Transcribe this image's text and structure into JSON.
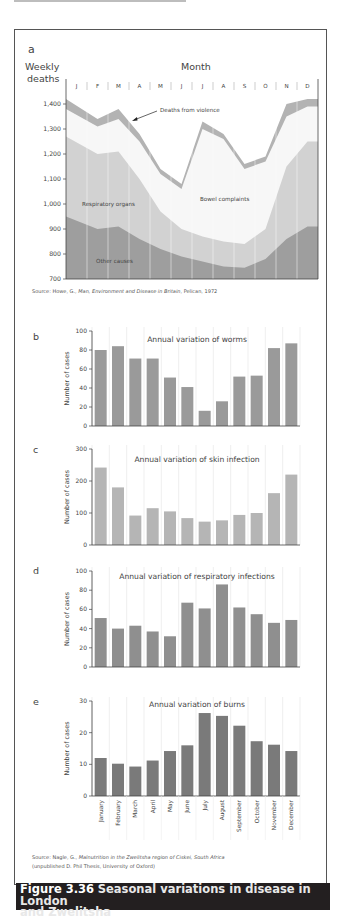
{
  "figure": {
    "number": "Figure 3.36",
    "title": "Seasonal variations in disease in London and Zwelitsha",
    "title_line1": "Seasonal variations in disease in London",
    "title_line2": "and Zwelitsha"
  },
  "panel_a": {
    "letter": "a",
    "ylabel_line1": "Weekly",
    "ylabel_line2": "deaths",
    "xlabel": "Month",
    "months": [
      "J",
      "F",
      "M",
      "A",
      "M",
      "J",
      "J",
      "A",
      "S",
      "O",
      "N",
      "D"
    ],
    "yticks": [
      "1,400",
      "1,300",
      "1,200",
      "1,100",
      "1,000",
      "900",
      "800",
      "700"
    ],
    "annotations": {
      "violence": "Deaths from violence",
      "respiratory": "Respiratory organs",
      "bowel": "Bowel complaints",
      "other": "Other causes"
    },
    "source_prefix": "Source: Howe, G., ",
    "source_title": "Man, Environment and Disease in Britain",
    "source_suffix": ", Pelican, 1972",
    "colors": {
      "other": "#9e9e9e",
      "respiratory": "#d2d2d2",
      "bowel": "#f7f7f7",
      "violence": "#b3b3b3"
    }
  },
  "bar_charts": {
    "ylabel": "Number of cases",
    "months": [
      "January",
      "February",
      "March",
      "April",
      "May",
      "June",
      "July",
      "August",
      "September",
      "October",
      "November",
      "December"
    ],
    "source_prefix": "Source: Nagle, G., ",
    "source_title": "Malnutrition in the Zwelitsha region of Ciskei, South Africa",
    "source_line2": "(unpublished D. Phil Thesis, University of Oxford)",
    "b": {
      "letter": "b",
      "title": "Annual variation of worms",
      "yticks": [
        "100",
        "80",
        "60",
        "40",
        "20",
        "0"
      ],
      "color": "#9a9a9a"
    },
    "c": {
      "letter": "c",
      "title": "Annual variation of skin infection",
      "yticks": [
        "300",
        "200",
        "100",
        "0"
      ],
      "color": "#b5b5b5"
    },
    "d": {
      "letter": "d",
      "title": "Annual variation of respiratory infections",
      "yticks": [
        "100",
        "80",
        "60",
        "40",
        "20",
        "0"
      ],
      "color": "#8f8f8f"
    },
    "e": {
      "letter": "e",
      "title": "Annual variation of burns",
      "yticks": [
        "30",
        "20",
        "10",
        "0"
      ],
      "color": "#7a7a7a"
    }
  },
  "chart_data": [
    {
      "type": "area",
      "title": "Weekly deaths by cause (London)",
      "xlabel": "Month",
      "ylabel": "Weekly deaths",
      "ylim": [
        700,
        1450
      ],
      "categories": [
        "J",
        "F",
        "M",
        "A",
        "M",
        "J",
        "J",
        "A",
        "S",
        "O",
        "N",
        "D"
      ],
      "stacking": "cumulative",
      "series": [
        {
          "name": "Other causes",
          "values": [
            950,
            900,
            910,
            860,
            820,
            790,
            770,
            750,
            745,
            780,
            860,
            910
          ]
        },
        {
          "name": "Respiratory organs",
          "values": [
            1270,
            1200,
            1210,
            1100,
            970,
            900,
            870,
            850,
            840,
            900,
            1150,
            1250
          ]
        },
        {
          "name": "Bowel complaints",
          "values": [
            1380,
            1310,
            1340,
            1250,
            1120,
            1060,
            1300,
            1260,
            1140,
            1170,
            1350,
            1390
          ]
        },
        {
          "name": "Deaths from violence",
          "values": [
            1420,
            1340,
            1380,
            1280,
            1140,
            1080,
            1330,
            1280,
            1160,
            1190,
            1400,
            1420
          ]
        }
      ]
    },
    {
      "type": "bar",
      "title": "Annual variation of worms",
      "xlabel": "",
      "ylabel": "Number of cases",
      "ylim": [
        0,
        100
      ],
      "categories": [
        "January",
        "February",
        "March",
        "April",
        "May",
        "June",
        "July",
        "August",
        "September",
        "October",
        "November",
        "December"
      ],
      "values": [
        80,
        84,
        71,
        71,
        51,
        41,
        16,
        26,
        52,
        53,
        82,
        87
      ]
    },
    {
      "type": "bar",
      "title": "Annual variation of skin infection",
      "xlabel": "",
      "ylabel": "Number of cases",
      "ylim": [
        0,
        300
      ],
      "categories": [
        "January",
        "February",
        "March",
        "April",
        "May",
        "June",
        "July",
        "August",
        "September",
        "October",
        "November",
        "December"
      ],
      "values": [
        242,
        180,
        92,
        115,
        105,
        84,
        73,
        77,
        94,
        100,
        162,
        220
      ]
    },
    {
      "type": "bar",
      "title": "Annual variation of respiratory infections",
      "xlabel": "",
      "ylabel": "Number of cases",
      "ylim": [
        0,
        100
      ],
      "categories": [
        "January",
        "February",
        "March",
        "April",
        "May",
        "June",
        "July",
        "August",
        "September",
        "October",
        "November",
        "December"
      ],
      "values": [
        51,
        40,
        43,
        37,
        32,
        67,
        61,
        86,
        62,
        55,
        46,
        49
      ]
    },
    {
      "type": "bar",
      "title": "Annual variation of burns",
      "xlabel": "",
      "ylabel": "Number of cases",
      "ylim": [
        0,
        30
      ],
      "categories": [
        "January",
        "February",
        "March",
        "April",
        "May",
        "June",
        "July",
        "August",
        "September",
        "October",
        "November",
        "December"
      ],
      "values": [
        12,
        10.2,
        9.3,
        11.2,
        14.2,
        16,
        26.2,
        25.3,
        22.2,
        17.3,
        16.2,
        14.2
      ]
    }
  ]
}
